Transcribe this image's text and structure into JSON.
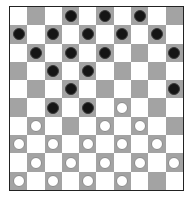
{
  "game": "international-draughts",
  "board": {
    "size": 10,
    "colors": {
      "light": "#ffffff",
      "dark": "#a3a3a3",
      "border": "#222222",
      "black_piece": "#151515",
      "white_piece": "#ffffff"
    },
    "rows": [
      [
        ".",
        "_",
        ".",
        "b",
        ".",
        "b",
        ".",
        "b",
        ".",
        "_"
      ],
      [
        "b",
        ".",
        "b",
        ".",
        "b",
        ".",
        "b",
        ".",
        "b",
        "."
      ],
      [
        ".",
        "b",
        ".",
        "b",
        ".",
        "b",
        ".",
        "_",
        ".",
        "b"
      ],
      [
        "_",
        ".",
        "b",
        ".",
        "b",
        ".",
        "_",
        ".",
        "_",
        "."
      ],
      [
        ".",
        "_",
        ".",
        "b",
        ".",
        "_",
        ".",
        "_",
        ".",
        "b"
      ],
      [
        "_",
        ".",
        "b",
        ".",
        "b",
        ".",
        "w",
        ".",
        "_",
        "."
      ],
      [
        ".",
        "w",
        ".",
        "_",
        ".",
        "w",
        ".",
        "w",
        ".",
        "_"
      ],
      [
        "w",
        ".",
        "w",
        ".",
        "w",
        ".",
        "w",
        ".",
        "w",
        "."
      ],
      [
        ".",
        "w",
        ".",
        "w",
        ".",
        "w",
        ".",
        "w",
        ".",
        "w"
      ],
      [
        "w",
        ".",
        "w",
        ".",
        "w",
        ".",
        "w",
        ".",
        "_",
        "."
      ]
    ],
    "legend": {
      ".": "light-square",
      "_": "empty-dark-square",
      "b": "black-man",
      "w": "white-man"
    },
    "counts": {
      "black": 17,
      "white": 19
    }
  }
}
